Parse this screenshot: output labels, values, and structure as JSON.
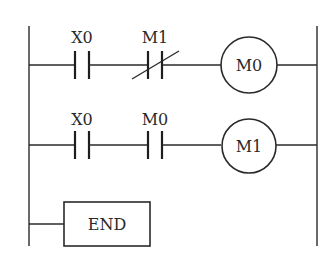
{
  "diagram": {
    "type": "ladder",
    "rungs": [
      {
        "elements": [
          {
            "kind": "contact_no",
            "label": "X0"
          },
          {
            "kind": "contact_nc",
            "label": "M1"
          },
          {
            "kind": "coil",
            "label": "M0"
          }
        ]
      },
      {
        "elements": [
          {
            "kind": "contact_no",
            "label": "X0"
          },
          {
            "kind": "contact_no",
            "label": "M0"
          },
          {
            "kind": "coil",
            "label": "M1"
          }
        ]
      },
      {
        "elements": [
          {
            "kind": "instruction",
            "label": "END"
          }
        ]
      }
    ]
  }
}
